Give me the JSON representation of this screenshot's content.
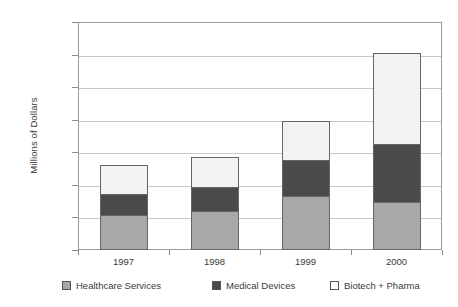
{
  "chart_data": {
    "type": "bar",
    "subtype": "stacked-bar",
    "title": "",
    "xlabel": "",
    "ylabel": "Millions of Dollars",
    "categories": [
      "1997",
      "1998",
      "1999",
      "2000"
    ],
    "ylim": [
      0,
      7000
    ],
    "yticks": [
      0,
      1000,
      2000,
      3000,
      4000,
      5000,
      6000,
      7000
    ],
    "ytick_labels": [
      "0",
      "1000",
      "2000",
      "3000",
      "4000",
      "5000",
      "6000",
      "7000"
    ],
    "grid": true,
    "grid_axis": "y",
    "legend_position": "bottom",
    "series": [
      {
        "name": "Healthcare Services",
        "color": "#a8a8a8",
        "values": [
          1080,
          1200,
          1650,
          1480
        ]
      },
      {
        "name": "Medical Devices",
        "color": "#4a4a4a",
        "values": [
          640,
          730,
          1100,
          1770
        ]
      },
      {
        "name": "Biotech + Pharma",
        "color": "#ffffff",
        "values": [
          880,
          920,
          1200,
          2800
        ]
      }
    ],
    "totals": [
      2600,
      2850,
      3950,
      6050
    ]
  }
}
